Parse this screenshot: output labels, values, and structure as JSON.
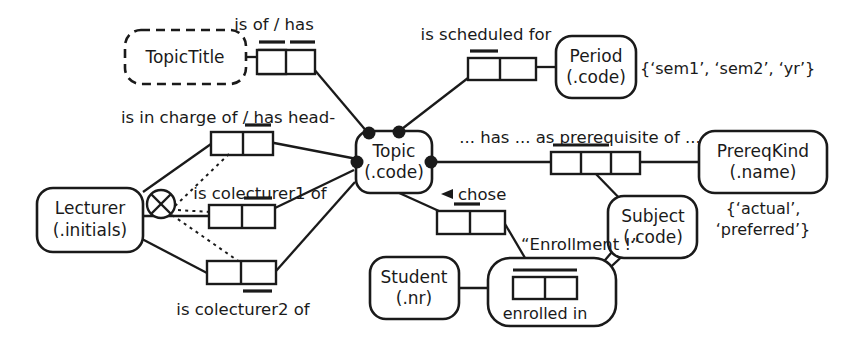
{
  "diagram": {
    "type": "orm-conceptual-schema"
  },
  "objects": {
    "topic_title": {
      "name": "TopicTitle",
      "kind": "value-type",
      "border": "dashed"
    },
    "period": {
      "name": "Period",
      "ref": "(.code)",
      "kind": "entity-type"
    },
    "topic": {
      "name": "Topic",
      "ref": "(.code)",
      "kind": "entity-type"
    },
    "prereq_kind": {
      "name": "PrereqKind",
      "ref": "(.name)",
      "kind": "entity-type"
    },
    "lecturer": {
      "name": "Lecturer",
      "ref": "(.initials)",
      "kind": "entity-type"
    },
    "subject": {
      "name": "Subject",
      "ref": "(.code)",
      "kind": "entity-type"
    },
    "student": {
      "name": "Student",
      "ref": "(.nr)",
      "kind": "entity-type"
    },
    "enrollment": {
      "name": "“Enrollment !”",
      "kind": "objectified-fact-type",
      "inner_label": "enrolled in"
    }
  },
  "predicates": {
    "is_of_has": {
      "label": "is of / has",
      "roles": 2
    },
    "is_scheduled_for": {
      "label": "is scheduled for",
      "roles": 2
    },
    "is_in_charge_of": {
      "label": "is in charge of / has head-",
      "roles": 2
    },
    "is_colecturer1_of": {
      "label": "is colecturer1 of",
      "roles": 2
    },
    "is_colecturer2_of": {
      "label": "is colecturer2 of",
      "roles": 2
    },
    "prerequisite": {
      "label": "... has ... as prerequisite of ...",
      "roles": 3
    },
    "chose": {
      "label": "chose",
      "roles": 2
    },
    "enrolled_in": {
      "label": "enrolled in",
      "roles": 2
    }
  },
  "constraints": {
    "period_values": "{‘sem1’, ‘sem2’, ‘yr’}",
    "prereq_kind_values": "{‘actual’,\n‘preferred’}",
    "prereq_kind_values_line1": "{‘actual’,",
    "prereq_kind_values_line2": "‘preferred’}",
    "exclusion": {
      "symbol": "⊗",
      "name": "exclusion-constraint"
    }
  },
  "colors": {
    "ink": "#1a1a1a",
    "paper": "#ffffff"
  }
}
